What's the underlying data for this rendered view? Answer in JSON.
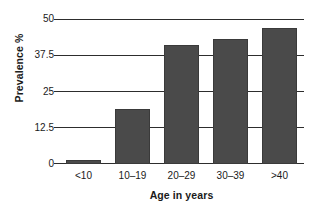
{
  "chart_data": {
    "type": "bar",
    "title": "",
    "xlabel": "Age in years",
    "ylabel": "Prevalence %",
    "categories": [
      "<10",
      "10–19",
      "20–29",
      "30–39",
      ">40"
    ],
    "values": [
      1.5,
      19,
      41,
      43,
      47
    ],
    "ylim": [
      0,
      50
    ],
    "yticks": [
      0,
      12.5,
      25,
      37.5,
      50
    ],
    "ytick_labels": [
      "0",
      "12.5",
      "25",
      "37.5",
      "50"
    ],
    "grid": true,
    "legend": null,
    "series": [
      {
        "name": "Prevalence %",
        "values": [
          1.5,
          19,
          41,
          43,
          47
        ]
      }
    ],
    "colors": {
      "bar_fill": "#4a4a4a",
      "axis": "#2d2d2d",
      "background": "#ffffff",
      "text": "#1a1a1a"
    }
  }
}
